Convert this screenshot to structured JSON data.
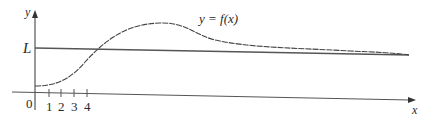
{
  "figure": {
    "curve_label": "y = f(x)",
    "asymptote_label": "L",
    "x_axis_label": "x",
    "y_axis_label": "y",
    "origin_label": "0",
    "x_ticks": [
      "1",
      "2",
      "3",
      "4"
    ]
  },
  "colors": {
    "ink": "#3a3a3a",
    "background": "#ffffff"
  }
}
